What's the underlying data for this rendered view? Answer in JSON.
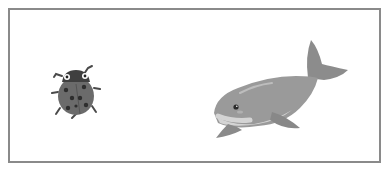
{
  "scene": {
    "frame": {
      "border_color": "#8a8a8a",
      "background": "#ffffff"
    },
    "objects": [
      {
        "id": "ladybug",
        "label": "ladybug",
        "position": "left",
        "color_body": "#6b6b6b",
        "color_head": "#3f3f3f",
        "spots": 7
      },
      {
        "id": "whale",
        "label": "whale",
        "position": "right",
        "color_body": "#9a9a9a",
        "color_belly": "#d4d4d4",
        "color_fin": "#8c8c8c"
      }
    ],
    "style": "grayscale cartoon illustration"
  }
}
